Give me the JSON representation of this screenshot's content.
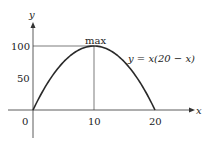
{
  "chart_data": {
    "type": "line",
    "title": "",
    "xlabel": "x",
    "ylabel": "y",
    "xlim": [
      0,
      20
    ],
    "ylim": [
      0,
      100
    ],
    "x_ticks": [
      "0",
      "10",
      "20"
    ],
    "y_ticks": [
      "50",
      "100"
    ],
    "series": [
      {
        "name": "y = x(20 − x)",
        "x": [
          0,
          2,
          4,
          6,
          8,
          10,
          12,
          14,
          16,
          18,
          20
        ],
        "values": [
          0,
          36,
          64,
          84,
          96,
          100,
          96,
          84,
          64,
          36,
          0
        ]
      }
    ],
    "annotations": [
      {
        "text": "max",
        "x": 10,
        "y": 100
      },
      {
        "text": "y = x(20 − x)",
        "x": 16,
        "y": 75
      }
    ],
    "grid": false,
    "legend": "none"
  },
  "labels": {
    "x_axis": "x",
    "y_axis": "y",
    "tick_0": "0",
    "tick_10": "10",
    "tick_20": "20",
    "tick_50": "50",
    "tick_100": "100",
    "max_label": "max",
    "equation_label": "y = x(20 − x)"
  },
  "colors": {
    "curve": "#2a2a2a",
    "axes": "#333333",
    "guide": "#444444"
  }
}
